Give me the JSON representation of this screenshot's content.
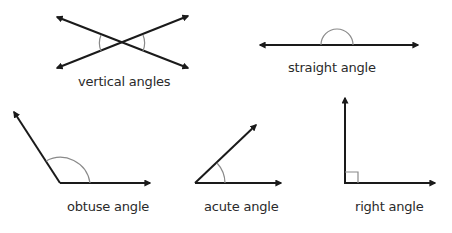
{
  "diagram": {
    "colors": {
      "line": "#1a1a1a",
      "arc": "#8a8a8a",
      "text": "#2a2a2a",
      "background": "#ffffff"
    },
    "figures": [
      {
        "id": "vertical",
        "label": "vertical angles"
      },
      {
        "id": "straight",
        "label": "straight angle"
      },
      {
        "id": "obtuse",
        "label": "obtuse angle"
      },
      {
        "id": "acute",
        "label": "acute angle"
      },
      {
        "id": "right",
        "label": "right angle"
      }
    ]
  }
}
